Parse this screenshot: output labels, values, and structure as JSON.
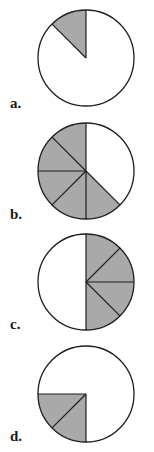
{
  "colors": {
    "fill": "#a9a9a9",
    "stroke": "#1e1e1e",
    "background": "#ffffff"
  },
  "options": [
    {
      "label": "a.",
      "cx": 86,
      "cy": 58,
      "r": 48,
      "label_x": 10,
      "label_y": 95,
      "slices_total": 8,
      "shaded_fraction": "1/8",
      "shaded_sectors": [
        [
          315,
          360
        ]
      ],
      "division_angles": [
        0,
        315
      ]
    },
    {
      "label": "b.",
      "cx": 86,
      "cy": 171,
      "r": 48,
      "label_x": 10,
      "label_y": 206,
      "slices_total": 8,
      "shaded_fraction": "5/8",
      "shaded_sectors": [
        [
          135,
          360
        ]
      ],
      "division_angles": [
        0,
        135,
        180,
        225,
        270,
        315
      ]
    },
    {
      "label": "c.",
      "cx": 86,
      "cy": 282,
      "r": 48,
      "label_x": 10,
      "label_y": 316,
      "slices_total": 8,
      "shaded_fraction": "4/8",
      "shaded_sectors": [
        [
          0,
          180
        ]
      ],
      "division_angles": [
        0,
        45,
        90,
        135,
        180
      ]
    },
    {
      "label": "d.",
      "cx": 86,
      "cy": 394,
      "r": 48,
      "label_x": 10,
      "label_y": 428,
      "slices_total": 8,
      "shaded_fraction": "2/8",
      "shaded_sectors": [
        [
          180,
          270
        ]
      ],
      "division_angles": [
        180,
        225,
        270
      ]
    }
  ]
}
